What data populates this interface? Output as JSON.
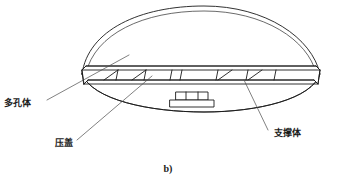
{
  "figure": {
    "caption": "b)",
    "background_color": "#ffffff",
    "line_color": "#1b1b1b",
    "leader_color": "#4a4a4a",
    "text_color": "#1a1a1a"
  },
  "labels": [
    {
      "id": "porous-body",
      "text": "多孔体",
      "text_x": 4,
      "text_y": 106,
      "leader": "M 47 100 L 129 55"
    },
    {
      "id": "gland-cover",
      "text": "压盖",
      "text_y": 146,
      "text_x": 55,
      "leader": "M 77 140 L 152 76"
    },
    {
      "id": "support-body",
      "text": "支撑体",
      "text_x": 274,
      "text_y": 136,
      "leader": "M 268 130 L 244 80"
    }
  ],
  "geometry": {
    "dome_outer": "M 82 74 C 88 30 140 6 204 6 C 266 6 312 38 320 74",
    "dome_inner": "M 86 73 C 95 34 143 11 204 11 C 264 11 308 40 316 73",
    "body_lower": "M 82 74 C 92 100 150 112 204 112 C 258 112 312 99 320 74",
    "plate_top_front": "M 82 70 L 320 70",
    "plate_top_back": "M 86 66 L 316 66",
    "plate_bottom_front": "M 84 84 L 318 84",
    "plate_bottom_back": "M 88 80 L 314 80",
    "plate_left_cap": "M 82 70 L 86 66 M 82 70 L 84 84 M 84 84 L 88 80 M 86 66 L 88 80",
    "plate_right_cap": "M 320 70 L 316 66 M 320 70 L 318 84 M 318 84 L 314 80 M 316 66 L 314 80",
    "ribs_vertical": [
      {
        "x_top": 118,
        "x_bottom": 116
      },
      {
        "x_top": 146,
        "x_bottom": 144
      },
      {
        "x_top": 172,
        "x_bottom": 170
      },
      {
        "x_top": 182,
        "x_bottom": 180
      },
      {
        "x_top": 218,
        "x_bottom": 216
      },
      {
        "x_top": 248,
        "x_bottom": 246
      },
      {
        "x_top": 276,
        "x_bottom": 274
      }
    ],
    "ribs_diagonal": [
      "M 104 80 L 118 70",
      "M 132 80 L 146 70",
      "M 232 70 L 218 80",
      "M 262 70 L 248 80"
    ],
    "hub": {
      "neck_top": "M 172 92 L 212 92",
      "neck_rect": "M 176 92 L 176 100 L 208 100 L 208 92",
      "neck_divider_left": "M 186 92 L 186 100",
      "neck_divider_right": "M 198 92 L 198 100",
      "foot_rect": "M 170 100 L 170 107 L 214 107 L 214 100"
    },
    "plate_underline": "M 84 88 L 318 88"
  }
}
